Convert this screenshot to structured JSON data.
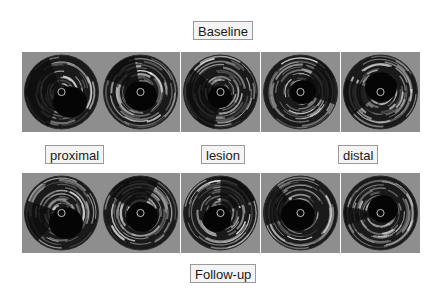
{
  "figure": {
    "title_top": "Baseline",
    "title_bottom": "Follow-up",
    "segment_labels": [
      "proximal",
      "lesion",
      "distal"
    ]
  },
  "rows": [
    {
      "name": "Baseline",
      "frames": [
        {
          "segment": "proximal",
          "lumen": {
            "cx": 48,
            "cy": 50,
            "r": 17
          },
          "dark_wedge": [
            110,
            250
          ]
        },
        {
          "segment": "proximal",
          "lumen": {
            "cx": 40,
            "cy": 44,
            "r": 16
          },
          "dark_wedge": [
            200,
            260
          ]
        },
        {
          "segment": "lesion",
          "lumen": {
            "cx": 39,
            "cy": 45,
            "r": 12
          },
          "dark_wedge": [
            100,
            220
          ]
        },
        {
          "segment": "distal",
          "lumen": {
            "cx": 42,
            "cy": 40,
            "r": 13
          },
          "dark_wedge": [
            300,
            20
          ]
        },
        {
          "segment": "distal",
          "lumen": {
            "cx": 40,
            "cy": 35,
            "r": 16
          },
          "dark_wedge": [
            140,
            200
          ]
        }
      ]
    },
    {
      "name": "Follow-up",
      "frames": [
        {
          "segment": "proximal",
          "lumen": {
            "cx": 44,
            "cy": 50,
            "r": 17
          },
          "dark_wedge": [
            130,
            200
          ]
        },
        {
          "segment": "proximal",
          "lumen": {
            "cx": 41,
            "cy": 44,
            "r": 16
          },
          "dark_wedge": [
            210,
            300
          ]
        },
        {
          "segment": "lesion",
          "lumen": {
            "cx": 36,
            "cy": 46,
            "r": 14
          },
          "dark_wedge": [
            270,
            340
          ]
        },
        {
          "segment": "distal",
          "lumen": {
            "cx": 37,
            "cy": 42,
            "r": 17
          },
          "dark_wedge": [
            160,
            230
          ]
        },
        {
          "segment": "distal",
          "lumen": {
            "cx": 42,
            "cy": 36,
            "r": 15
          },
          "dark_wedge": [
            160,
            190
          ]
        }
      ]
    }
  ],
  "colors": {
    "frame_background": "#8e8e8e",
    "label_border": "#9a9a9a",
    "label_background": "#f4f4f4"
  }
}
